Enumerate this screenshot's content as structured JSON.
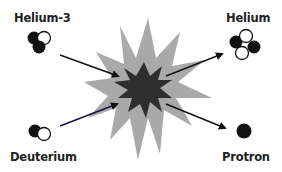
{
  "diagram": {
    "type": "nuclear-fusion-reaction",
    "reactants": [
      {
        "id": "helium-3",
        "label": "Helium-3",
        "particles": {
          "protons": 2,
          "neutrons": 1
        }
      },
      {
        "id": "deuterium",
        "label": "Deuterium",
        "particles": {
          "protons": 1,
          "neutrons": 1
        }
      }
    ],
    "products": [
      {
        "id": "helium",
        "label": "Helium",
        "particles": {
          "protons": 2,
          "neutrons": 2
        }
      },
      {
        "id": "protron",
        "label": "Protron",
        "particles": {
          "protons": 1,
          "neutrons": 0
        }
      }
    ],
    "center": {
      "shape": "explosion-burst",
      "outer_color": "#a9a9a9",
      "inner_color": "#2e2e2e"
    },
    "colors": {
      "proton": "#111111",
      "neutron": "#ffffff",
      "neutron_outline": "#111111",
      "arrow": "#111111",
      "text": "#222222"
    }
  }
}
